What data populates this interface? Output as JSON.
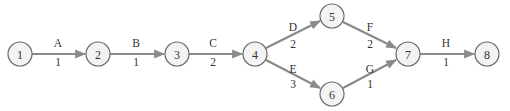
{
  "diagram": {
    "type": "activity-on-arrow network",
    "nodes": [
      {
        "id": "1",
        "label": "1",
        "x": 20,
        "y": 54
      },
      {
        "id": "2",
        "label": "2",
        "x": 98,
        "y": 54
      },
      {
        "id": "3",
        "label": "3",
        "x": 177,
        "y": 54
      },
      {
        "id": "4",
        "label": "4",
        "x": 255,
        "y": 54
      },
      {
        "id": "5",
        "label": "5",
        "x": 332,
        "y": 16
      },
      {
        "id": "6",
        "label": "6",
        "x": 332,
        "y": 94
      },
      {
        "id": "7",
        "label": "7",
        "x": 408,
        "y": 54
      },
      {
        "id": "8",
        "label": "8",
        "x": 487,
        "y": 54
      }
    ],
    "edges": [
      {
        "from": "1",
        "to": "2",
        "activity": "A",
        "duration": "1"
      },
      {
        "from": "2",
        "to": "3",
        "activity": "B",
        "duration": "1"
      },
      {
        "from": "3",
        "to": "4",
        "activity": "C",
        "duration": "2"
      },
      {
        "from": "4",
        "to": "5",
        "activity": "D",
        "duration": "2"
      },
      {
        "from": "4",
        "to": "6",
        "activity": "E",
        "duration": "3"
      },
      {
        "from": "5",
        "to": "7",
        "activity": "F",
        "duration": "2"
      },
      {
        "from": "6",
        "to": "7",
        "activity": "G",
        "duration": "1"
      },
      {
        "from": "7",
        "to": "8",
        "activity": "H",
        "duration": "1"
      }
    ],
    "colors": {
      "edge": "#8a8a8a",
      "node_fill": "#f3f3f3",
      "node_stroke": "#6a6a6a",
      "text": "#333333"
    }
  }
}
